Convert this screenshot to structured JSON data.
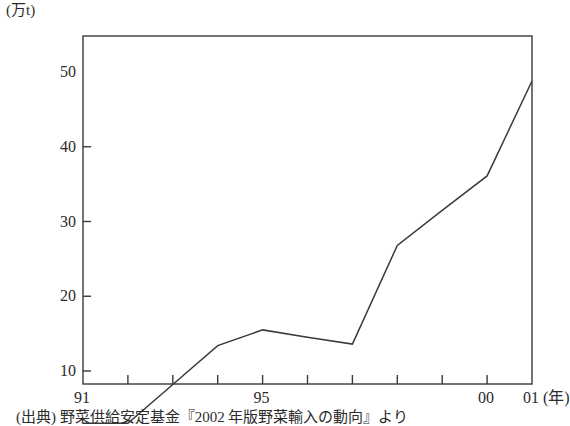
{
  "figure": {
    "unit_label": "(万t)",
    "source_note": "(出典) 野菜供給安定基金『2002 年版野菜輸入の動向』より",
    "axis_color": "#3a3a38",
    "line_color": "#3a3a38",
    "background": "#ffffff"
  },
  "chart_data": {
    "type": "line",
    "title": "",
    "xlabel": "(年)",
    "ylabel": "(万t)",
    "x": [
      1991,
      1992,
      1993,
      1994,
      1995,
      1996,
      1997,
      1998,
      1999,
      2000,
      2001
    ],
    "x_tick_labels": [
      "91",
      "",
      "",
      "",
      "95",
      "",
      "",
      "",
      "",
      "00",
      "01"
    ],
    "x_tick_labels_shown": [
      "91",
      "95",
      "00",
      "01"
    ],
    "x_axis_suffix": "(年)",
    "values": [
      3.0,
      3.0,
      8.2,
      13.4,
      15.5,
      14.5,
      13.6,
      26.8,
      31.5,
      36.1,
      48.8
    ],
    "series": [
      {
        "name": "野菜輸入量",
        "values": [
          3.0,
          3.0,
          8.2,
          13.4,
          15.5,
          14.5,
          13.6,
          26.8,
          31.5,
          36.1,
          48.8
        ]
      }
    ],
    "ylim": [
      0,
      50
    ],
    "y_ticks": [
      10,
      20,
      30,
      40,
      50
    ],
    "y_tick_labels": [
      "10",
      "20",
      "30",
      "40",
      "50"
    ],
    "xlim": [
      1991,
      2001
    ],
    "grid": false,
    "legend": "none",
    "markers": false
  }
}
